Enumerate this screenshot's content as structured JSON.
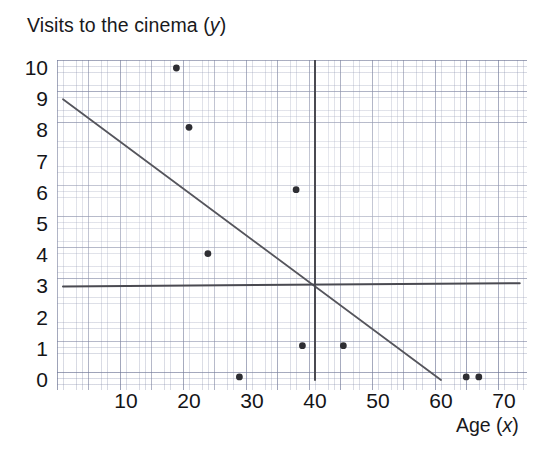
{
  "chart_data": {
    "type": "scatter",
    "title": "",
    "ylabel": "Visits to the cinema (y)",
    "ylabel_text": "Visits to the cinema (",
    "ylabel_var": "y",
    "ylabel_tail": ")",
    "xlabel": "Age (x)",
    "xlabel_text": "Age (",
    "xlabel_var": "x",
    "xlabel_tail": ")",
    "xlim": [
      0,
      72.5
    ],
    "ylim": [
      0,
      10.3
    ],
    "grid": true,
    "legend": "none",
    "xticks": [
      10,
      20,
      30,
      40,
      50,
      60,
      70
    ],
    "yticks": [
      0,
      1,
      2,
      3,
      4,
      5,
      6,
      7,
      8,
      9,
      10
    ],
    "points": [
      {
        "x": 18,
        "y": 10.0
      },
      {
        "x": 20,
        "y": 8.1
      },
      {
        "x": 23,
        "y": 4.05
      },
      {
        "x": 28,
        "y": 0.1
      },
      {
        "x": 37,
        "y": 6.1
      },
      {
        "x": 38,
        "y": 1.1
      },
      {
        "x": 44.5,
        "y": 1.1
      },
      {
        "x": 64,
        "y": 0.1
      },
      {
        "x": 66,
        "y": 0.1
      }
    ],
    "lines": [
      {
        "name": "line-of-best-fit",
        "x1": 0,
        "y1": 9.0,
        "x2": 60,
        "y2": 0.0,
        "color": "#55555c"
      },
      {
        "name": "mean-y-line",
        "x1": 0,
        "y1": 3.0,
        "x2": 72.5,
        "y2": 3.1,
        "color": "#4a4a51"
      },
      {
        "name": "mean-x-line",
        "x1": 40,
        "y1": 0.0,
        "x2": 40,
        "y2": 10.3,
        "color": "#4a4a51"
      }
    ],
    "colors": {
      "dot": "#2e2e33",
      "fit_line": "#55555c",
      "mean_line": "#4a4a51",
      "grid": "#7880a0"
    }
  },
  "axis": {
    "y_tick_labels": [
      "10",
      "9",
      "8",
      "7",
      "6",
      "5",
      "4",
      "3",
      "2",
      "1",
      "0"
    ],
    "x_tick_labels": [
      "10",
      "20",
      "30",
      "40",
      "50",
      "60",
      "70"
    ]
  }
}
